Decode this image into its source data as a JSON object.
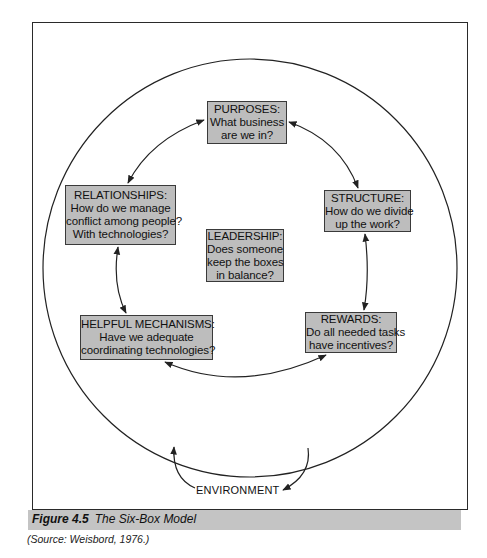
{
  "figure": {
    "label": "Figure 4.5",
    "title": "The Six-Box Model",
    "source": "(Source: Weisbord, 1976.)"
  },
  "boxes": {
    "purposes": {
      "heading": "PURPOSES:",
      "lines": [
        "What business",
        "are we in?"
      ]
    },
    "structure": {
      "heading": "STRUCTURE:",
      "lines": [
        "How do we divide",
        "up the work?"
      ]
    },
    "relationships": {
      "heading": "RELATIONSHIPS:",
      "lines": [
        "How do we manage",
        "conflict among people?",
        "With technologies?"
      ]
    },
    "leadership": {
      "heading": "LEADERSHIP:",
      "lines": [
        "Does someone",
        "keep the boxes",
        "in balance?"
      ]
    },
    "helpful_mechanisms": {
      "heading": "HELPFUL MECHANISMS:",
      "lines": [
        "Have we adequate",
        "coordinating technologies?"
      ]
    },
    "rewards": {
      "heading": "REWARDS:",
      "lines": [
        "Do all needed tasks",
        "have incentives?"
      ]
    }
  },
  "environment_label": "ENVIRONMENT",
  "colors": {
    "box_fill": "#bdbdbd",
    "line": "#222222",
    "caption_bar": "#c4c4c4"
  }
}
